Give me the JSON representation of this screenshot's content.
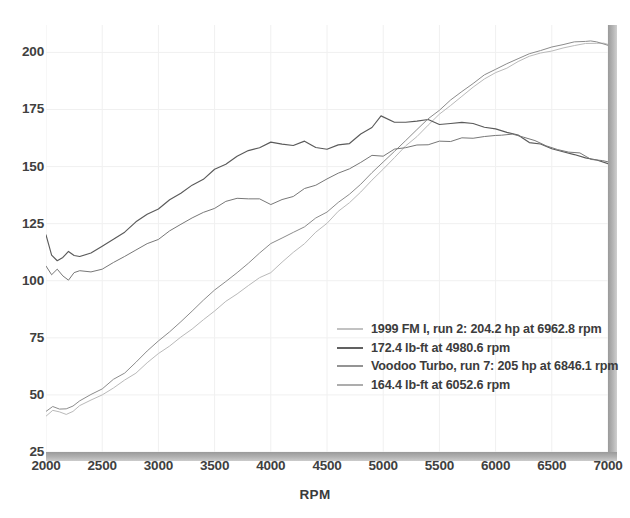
{
  "chart_data": {
    "type": "line",
    "title": "",
    "xlabel": "RPM",
    "ylabel": "",
    "xlim": [
      2000,
      7000
    ],
    "ylim": [
      25,
      212
    ],
    "grid": true,
    "legend_position": "inside-bottom-right",
    "xticks": [
      "2000",
      "2500",
      "3000",
      "3500",
      "4000",
      "4500",
      "5000",
      "5500",
      "6000",
      "6500",
      "7000"
    ],
    "yticks": [
      "25",
      "50",
      "75",
      "100",
      "125",
      "150",
      "175",
      "200"
    ],
    "series": [
      {
        "name": "1999 FM I, run 2: 204.2 hp at 6962.8 rpm",
        "metric": "horsepower",
        "color": "#b9b9b9",
        "peak_value": 204.2,
        "peak_rpm": 6962.8,
        "x": [
          2000,
          2060,
          2120,
          2180,
          2240,
          2300,
          2400,
          2500,
          2600,
          2700,
          2800,
          2900,
          3000,
          3100,
          3200,
          3300,
          3400,
          3500,
          3600,
          3700,
          3800,
          3900,
          4000,
          4100,
          4200,
          4300,
          4400,
          4500,
          4600,
          4700,
          4800,
          4900,
          5000,
          5100,
          5200,
          5300,
          5400,
          5500,
          5600,
          5700,
          5800,
          5900,
          6000,
          6100,
          6200,
          6300,
          6400,
          6500,
          6600,
          6700,
          6800,
          6900,
          6962.8,
          7000
        ],
        "y": [
          41,
          43,
          42.5,
          41.5,
          43,
          45,
          47.5,
          50,
          53,
          56.5,
          60,
          64,
          68,
          71.5,
          75,
          79,
          83,
          87,
          90.5,
          94,
          97.5,
          101,
          104,
          108,
          112,
          116.5,
          121,
          125.5,
          130,
          134.5,
          139,
          144,
          149,
          154,
          159,
          163.5,
          168,
          172.5,
          177,
          181,
          184.5,
          188,
          191,
          193.5,
          196,
          198,
          199.5,
          201,
          202,
          202.5,
          203.5,
          204,
          204.2,
          203.5
        ]
      },
      {
        "name": "172.4 lb-ft at 4980.6 rpm",
        "metric": "torque",
        "color": "#5a5a5a",
        "peak_value": 172.4,
        "peak_rpm": 4980.6,
        "x": [
          2000,
          2050,
          2100,
          2150,
          2200,
          2250,
          2300,
          2400,
          2500,
          2600,
          2700,
          2800,
          2900,
          3000,
          3100,
          3200,
          3300,
          3400,
          3500,
          3600,
          3700,
          3800,
          3900,
          4000,
          4100,
          4200,
          4300,
          4400,
          4500,
          4600,
          4700,
          4800,
          4900,
          4980.6,
          5100,
          5200,
          5300,
          5400,
          5500,
          5600,
          5700,
          5800,
          5900,
          6000,
          6100,
          6200,
          6300,
          6400,
          6500,
          6600,
          6700,
          6800,
          6900,
          7000
        ],
        "y": [
          121,
          112,
          109,
          110.5,
          112,
          111,
          110.5,
          112,
          115,
          118,
          121.5,
          125,
          128.5,
          132,
          135,
          138,
          141,
          144.5,
          148,
          151,
          154.5,
          157,
          159,
          161.5,
          160,
          158.5,
          161,
          159,
          157.5,
          159,
          161,
          164,
          168,
          172.4,
          170,
          169,
          169.5,
          170,
          168.5,
          169,
          169.5,
          169,
          168,
          166.5,
          165,
          163,
          161,
          159,
          157.5,
          156,
          155,
          154,
          153,
          152
        ]
      },
      {
        "name": "Voodoo Turbo, run 7: 205 hp at 6846.1 rpm",
        "metric": "horsepower",
        "color": "#8c8c8c",
        "peak_value": 205,
        "peak_rpm": 6846.1,
        "x": [
          2000,
          2060,
          2120,
          2180,
          2240,
          2300,
          2400,
          2500,
          2600,
          2700,
          2800,
          2900,
          3000,
          3100,
          3200,
          3300,
          3400,
          3500,
          3600,
          3700,
          3800,
          3900,
          4000,
          4100,
          4200,
          4300,
          4400,
          4500,
          4600,
          4700,
          4800,
          4900,
          5000,
          5100,
          5200,
          5300,
          5400,
          5500,
          5600,
          5700,
          5800,
          5900,
          6000,
          6100,
          6200,
          6300,
          6400,
          6500,
          6600,
          6700,
          6800,
          6846.1,
          6900,
          7000
        ],
        "y": [
          43,
          45,
          44,
          43.5,
          45,
          47,
          50,
          53,
          56.5,
          60,
          64.5,
          69,
          73.5,
          78,
          82.5,
          87,
          91.5,
          96,
          100,
          104,
          108,
          112,
          116,
          119,
          121.5,
          124,
          127,
          130.5,
          134,
          138,
          142,
          147,
          152,
          157,
          161.5,
          166,
          170.5,
          175,
          179,
          183,
          186.5,
          190,
          193,
          195.5,
          197.5,
          199.5,
          201,
          202.5,
          203.5,
          204.5,
          205,
          205,
          204.5,
          203
        ]
      },
      {
        "name": "164.4 lb-ft at 6052.6 rpm",
        "metric": "torque",
        "color": "#777777",
        "peak_value": 164.4,
        "peak_rpm": 6052.6,
        "x": [
          2000,
          2050,
          2100,
          2150,
          2200,
          2250,
          2300,
          2400,
          2500,
          2600,
          2700,
          2800,
          2900,
          3000,
          3100,
          3200,
          3300,
          3400,
          3500,
          3600,
          3700,
          3800,
          3900,
          4000,
          4100,
          4200,
          4300,
          4400,
          4500,
          4600,
          4700,
          4800,
          4900,
          5000,
          5100,
          5200,
          5300,
          5400,
          5500,
          5600,
          5700,
          5800,
          5900,
          6000,
          6052.6,
          6150,
          6250,
          6350,
          6450,
          6550,
          6650,
          6750,
          6850,
          6950,
          7000
        ],
        "y": [
          107,
          102,
          105,
          103,
          101,
          104,
          103.5,
          104,
          106,
          108,
          110.5,
          113,
          116,
          119,
          122,
          125,
          128,
          130,
          132,
          134,
          135.5,
          136,
          135,
          133.5,
          135,
          137,
          139.5,
          142,
          144.5,
          147,
          149.5,
          152,
          154,
          155.5,
          157,
          158,
          159,
          160,
          161,
          161.5,
          162,
          162.5,
          163,
          164,
          164.4,
          163.5,
          162.5,
          161,
          159.5,
          158,
          157,
          155.5,
          154,
          153,
          152.5
        ]
      }
    ]
  },
  "axes": {
    "xlabel": "RPM",
    "xticks": [
      "2000",
      "2500",
      "3000",
      "3500",
      "4000",
      "4500",
      "5000",
      "5500",
      "6000",
      "6500",
      "7000"
    ],
    "yticks": [
      "200",
      "175",
      "150",
      "125",
      "100",
      "75",
      "50",
      "25"
    ]
  },
  "legend": {
    "items": [
      {
        "label": "1999 FM I, run 2: 204.2 hp at 6962.8 rpm",
        "color": "#c2c2c2"
      },
      {
        "label": "172.4 lb-ft at 4980.6 rpm",
        "color": "#616161"
      },
      {
        "label": "Voodoo Turbo, run 7: 205 hp at 6846.1 rpm",
        "color": "#949494"
      },
      {
        "label": "164.4 lb-ft at 6052.6 rpm",
        "color": "#adadad"
      }
    ]
  },
  "colors": {
    "grid": "#f0f0f0",
    "axis_bar": "#a8a8a8",
    "tick_text": "#404040",
    "background": "#ffffff"
  }
}
